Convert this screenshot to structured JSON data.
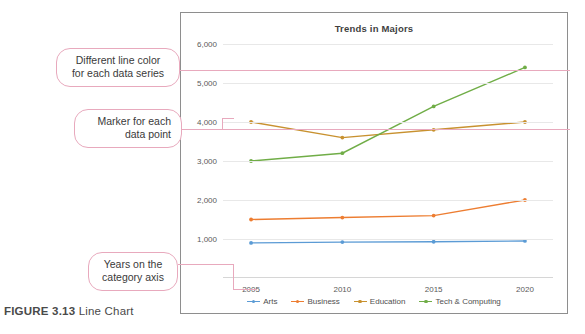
{
  "figure": {
    "label": "FIGURE 3.13",
    "caption": "Line Chart"
  },
  "chart": {
    "title": "Trends in Majors"
  },
  "annotations": [
    {
      "id": "line-color",
      "line1": "Different line color",
      "line2": "for each data series",
      "border_color": "#e8a9bd"
    },
    {
      "id": "marker",
      "line1": "Marker for each",
      "line2": "data point",
      "border_color": "#e8a9bd"
    },
    {
      "id": "years",
      "line1": "Years on the",
      "line2": "category axis",
      "border_color": "#e8a9bd"
    }
  ],
  "chart_data": {
    "type": "line",
    "title": "Trends in Majors",
    "xlabel": "",
    "ylabel": "",
    "categories": [
      "2005",
      "2010",
      "2015",
      "2020"
    ],
    "x": [
      2005,
      2010,
      2015,
      2020
    ],
    "ylim": [
      0,
      6000
    ],
    "yticks": [
      1000,
      2000,
      3000,
      4000,
      5000,
      6000
    ],
    "ytick_labels": [
      "1,000",
      "2,000",
      "3,000",
      "4,000",
      "5,000",
      "6,000"
    ],
    "grid": true,
    "legend_position": "bottom",
    "markers": true,
    "series": [
      {
        "name": "Arts",
        "color": "#5B9BD5",
        "values": [
          900,
          920,
          930,
          950
        ]
      },
      {
        "name": "Business",
        "color": "#ED7D31",
        "values": [
          1500,
          1550,
          1600,
          2000
        ]
      },
      {
        "name": "Education",
        "color": "#C8912F",
        "values": [
          4000,
          3600,
          3800,
          4000
        ]
      },
      {
        "name": "Tech & Computing",
        "color": "#70AD47",
        "values": [
          3000,
          3200,
          4400,
          5400
        ]
      }
    ]
  }
}
